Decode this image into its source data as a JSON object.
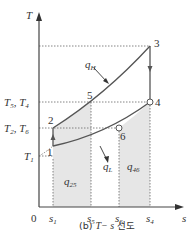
{
  "diagram": {
    "axes": {
      "y_label": "T",
      "x_label": "s",
      "origin_label": "0"
    },
    "y_ticks": [
      {
        "main": "T",
        "sub": "5",
        "main2": ", T",
        "sub2": "4"
      },
      {
        "main": "T",
        "sub": "2",
        "main2": ", T",
        "sub2": "6"
      },
      {
        "main": "T",
        "sub": "1"
      }
    ],
    "x_ticks": [
      {
        "main": "s",
        "sub": "1"
      },
      {
        "main": "s",
        "sub": "5"
      },
      {
        "main": "s",
        "sub": "6"
      },
      {
        "main": "s",
        "sub": "4"
      }
    ],
    "points": [
      "1",
      "2",
      "3",
      "4",
      "5",
      "6"
    ],
    "heat_labels": {
      "q_H": {
        "main": "q",
        "sub": "H"
      },
      "q_L": {
        "main": "q",
        "sub": "L"
      },
      "q_25": {
        "main": "q",
        "sub": "25"
      },
      "q_46": {
        "main": "q",
        "sub": "46"
      }
    },
    "caption": {
      "prefix": "(b) ",
      "italic": "T− s",
      "suffix": " 선도"
    },
    "colors": {
      "line": "#555555",
      "shade": "#e6e6e6",
      "dotted": "#666666"
    }
  }
}
